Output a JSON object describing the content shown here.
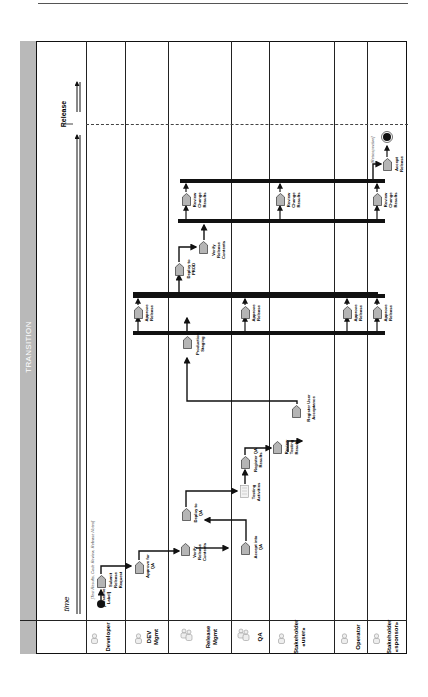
{
  "diagram": {
    "phase": "TRANSITION",
    "time_axis_label": "time",
    "milestone": "Release",
    "orientation": "rotated 90° counter-clockwise",
    "lanes": [
      {
        "id": "developer",
        "label": "Developer"
      },
      {
        "id": "dev_mgmt",
        "label": "DEV Mgmt"
      },
      {
        "id": "release_mgmt",
        "label": "Release Mgmt"
      },
      {
        "id": "qa",
        "label": "QA"
      },
      {
        "id": "stakeholder_user",
        "label": "Stakeholder «user»"
      },
      {
        "id": "operator",
        "label": "Operator"
      },
      {
        "id": "stakeholder_sponsor",
        "label": "Stakeholder «sponsor»"
      }
    ],
    "notes": {
      "start_note": "[Test Results, Code Review, Release Notes]",
      "start_state": "[Baseline Label]",
      "end_note": "[Retrospective]"
    },
    "activities": {
      "submit_release_request": "Submit Release Request",
      "approve_for_qa": "Approve for QA",
      "verify_release_contents_1": "Verify Release Contents",
      "deploy_to_qa": "Deploy to QA",
      "accept_into_qa": "Accept into QA",
      "testing_activities": "Testing Activities",
      "register_qa_results": "Register QA Results",
      "review_testing_results": "Review Testing Results",
      "register_user_acceptance": "Register User Acceptance",
      "production_staging": "Production Staging",
      "approve_release_dev": "Approve Release",
      "approve_release_qa": "Approve Release",
      "approve_release_operator": "Approve Release",
      "approve_release_sponsor": "Approve Release",
      "deploy_to_prod": "Deploy to PROD",
      "verify_release_contents_2": "Verify Release Contents",
      "review_change_results_dev": "Review Change Results",
      "review_change_results_qa": "Review Change Results",
      "review_change_results_sponsor": "Review Change Results",
      "accept_release": "Accept Release"
    }
  }
}
